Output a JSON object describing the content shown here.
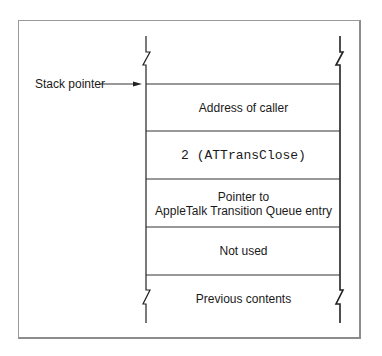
{
  "diagram": {
    "type": "stack-frame",
    "pointer_label": "Stack pointer",
    "cells": [
      {
        "id": "address-of-caller",
        "lines": [
          "Address of caller"
        ],
        "monospace": false
      },
      {
        "id": "selector",
        "lines": [
          "2 (ATTransClose)"
        ],
        "monospace": true
      },
      {
        "id": "queue-entry-pointer",
        "lines": [
          "Pointer to",
          "AppleTalk Transition Queue entry"
        ],
        "monospace": false
      },
      {
        "id": "not-used",
        "lines": [
          "Not used"
        ],
        "monospace": false
      }
    ],
    "bottom_label": "Previous contents",
    "colors": {
      "line": "#222222",
      "frame": "#9a9a9a",
      "text": "#1a1a1a",
      "background": "#ffffff"
    }
  }
}
